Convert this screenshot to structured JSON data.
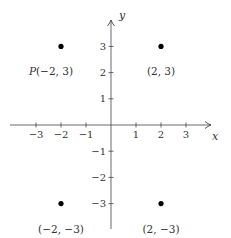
{
  "chart_data": {
    "type": "scatter",
    "title": "",
    "xlabel": "x",
    "ylabel": "y",
    "xlim": [
      -3.9,
      4.0
    ],
    "ylim": [
      -4.0,
      4.0
    ],
    "grid": false,
    "legend": null,
    "x_ticks": [
      -3,
      -2,
      -1,
      1,
      2,
      3
    ],
    "x_tick_labels": [
      "−3",
      "−2",
      "−1",
      "1",
      "2",
      "3"
    ],
    "y_ticks": [
      3,
      2,
      1,
      -1,
      -2,
      -3
    ],
    "y_tick_labels": [
      "3",
      "2",
      "1",
      "−1",
      "−2",
      "−3"
    ],
    "points": [
      {
        "x": -2,
        "y": 3,
        "label_prefix": "P",
        "label": "(−2, 3)"
      },
      {
        "x": 2,
        "y": 3,
        "label_prefix": "",
        "label": "(2, 3)"
      },
      {
        "x": -2,
        "y": -3,
        "label_prefix": "",
        "label": "(−2, −3)"
      },
      {
        "x": 2,
        "y": -3,
        "label_prefix": "",
        "label": "(2, −3)"
      }
    ]
  },
  "colors": {
    "axis": "#444444",
    "point": "#000000",
    "text": "#333333"
  }
}
